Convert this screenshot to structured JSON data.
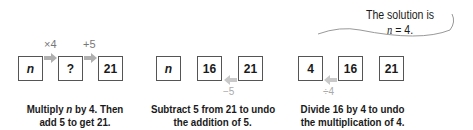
{
  "panels": [
    {
      "boxes": [
        {
          "value": "n",
          "italic": true
        },
        {
          "value": "?",
          "italic": false
        },
        {
          "value": "21",
          "italic": false
        }
      ],
      "operations": [
        "×4",
        "+5"
      ],
      "caption_line1_pre": "Multiply ",
      "caption_line1_var": "n",
      "caption_line1_post": " by 4. Then",
      "caption_line2": "add 5 to get 21."
    },
    {
      "boxes": [
        {
          "value": "n",
          "italic": true
        },
        {
          "value": "16",
          "italic": false
        },
        {
          "value": "21",
          "italic": false
        }
      ],
      "operations": [
        "−5"
      ],
      "caption_line1": "Subtract 5 from 21 to undo",
      "caption_line2": "the addition of 5."
    },
    {
      "boxes": [
        {
          "value": "4",
          "italic": false
        },
        {
          "value": "16",
          "italic": false
        },
        {
          "value": "21",
          "italic": false
        }
      ],
      "operations": [
        "÷4"
      ],
      "caption_line1": "Divide 16 by 4 to undo",
      "caption_line2": "the multiplication of 4."
    }
  ],
  "bubble": {
    "line1": "The solution is",
    "line2_var": "n",
    "line2_rest": " = 4."
  },
  "colors": {
    "arrow": "#b0b0b0",
    "box_border": "#555555",
    "op_text": "#777777"
  }
}
